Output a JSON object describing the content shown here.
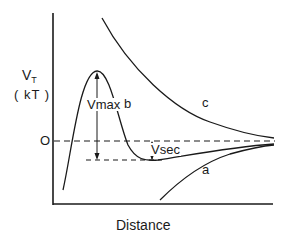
{
  "diagram": {
    "type": "potential-energy-vs-distance",
    "y_axis": {
      "label_main": "V",
      "label_sub": "T",
      "unit": "( kT )",
      "zero_tick": "O"
    },
    "x_axis": {
      "label": "Distance"
    },
    "curves": [
      {
        "id": "a",
        "label": "a",
        "description": "monotonic attractive curve below zero approaching zero"
      },
      {
        "id": "b",
        "label": "b",
        "description": "curve with primary maximum and secondary minimum"
      },
      {
        "id": "c",
        "label": "c",
        "description": "monotonic repulsive curve above zero approaching zero"
      }
    ],
    "annotations": {
      "vmax": "Vmax",
      "vsec": "Vsec"
    },
    "colors": {
      "line": "#1a1a1a",
      "background": "#ffffff"
    }
  }
}
